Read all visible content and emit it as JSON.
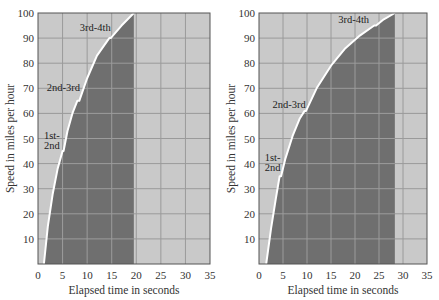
{
  "colors": {
    "light_bg": "#c9c9c9",
    "dark_fill": "#6f6f6f",
    "grid_on_light": "#9a9a9a",
    "grid_on_dark": "#9c9c9c",
    "curve": "#ffffff",
    "frame": "#555555"
  },
  "chart_data": [
    {
      "type": "area",
      "title": "",
      "xlabel": "Elapsed time in seconds",
      "ylabel": "Speed in miles per hour",
      "xlim": [
        0,
        35
      ],
      "ylim": [
        0,
        100
      ],
      "xticks": [
        0,
        5,
        10,
        15,
        20,
        25,
        30,
        35
      ],
      "yticks": [
        10,
        20,
        30,
        40,
        50,
        60,
        70,
        80,
        90,
        100
      ],
      "grid": true,
      "series": [
        {
          "name": "Speed",
          "x": [
            1.2,
            2,
            3,
            4,
            5,
            5.2,
            6,
            7,
            8,
            8.4,
            10,
            12,
            14.5,
            14.8,
            17,
            19.5
          ],
          "y": [
            0,
            15,
            28,
            38,
            45,
            45,
            53,
            60,
            65,
            65,
            74,
            83,
            90,
            90,
            95,
            100
          ]
        }
      ],
      "shaded_until_x": 19.5,
      "annotations": [
        {
          "text": "1st-",
          "x": 1.2,
          "y": 50
        },
        {
          "text": "2nd",
          "x": 1.2,
          "y": 46
        },
        {
          "text": "2nd-3rd",
          "x": 1.8,
          "y": 69
        },
        {
          "text": "3rd-4th",
          "x": 8.5,
          "y": 93
        }
      ]
    },
    {
      "type": "area",
      "title": "",
      "xlabel": "Elapsed time in seconds",
      "ylabel": "Speed in miles per hour",
      "xlim": [
        0,
        35
      ],
      "ylim": [
        0,
        100
      ],
      "xticks": [
        0,
        5,
        10,
        15,
        20,
        25,
        30,
        35
      ],
      "yticks": [
        10,
        20,
        30,
        40,
        50,
        60,
        70,
        80,
        90,
        100
      ],
      "grid": true,
      "series": [
        {
          "name": "Speed",
          "x": [
            1.5,
            2.5,
            3.5,
            4.3,
            4.6,
            5.5,
            7,
            8.5,
            9.5,
            9.8,
            12,
            15,
            18,
            21,
            24,
            24.4,
            26,
            28.3
          ],
          "y": [
            0,
            14,
            26,
            35,
            35,
            42,
            51,
            58,
            61,
            61,
            70,
            79,
            86,
            91,
            95,
            95,
            97.5,
            100
          ]
        }
      ],
      "shaded_until_x": 28.3,
      "annotations": [
        {
          "text": "1st-",
          "x": 1.2,
          "y": 41
        },
        {
          "text": "2nd",
          "x": 1.2,
          "y": 37
        },
        {
          "text": "2nd-3rd",
          "x": 2.8,
          "y": 62
        },
        {
          "text": "3rd-4th",
          "x": 16.5,
          "y": 96
        }
      ]
    }
  ]
}
